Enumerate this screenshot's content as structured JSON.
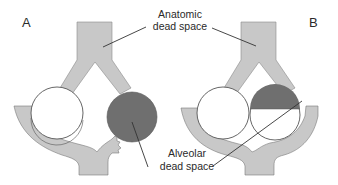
{
  "figure": {
    "type": "respiratory dead space schematic",
    "panels": [
      {
        "id": "A",
        "label": "A",
        "left_alveolus": "ventilated, perfused (white)",
        "right_alveolus": "ventilated, not perfused (entirely dark — alveolar dead space)",
        "capillary": "supplies left alveolus only; right branch ends abruptly (blocked)"
      },
      {
        "id": "B",
        "label": "B",
        "left_alveolus": "ventilated, perfused (white)",
        "right_alveolus": "partially perfused (upper half dark — alveolar dead space)",
        "capillary": "supplies both alveoli"
      }
    ],
    "annotations": {
      "anatomic": {
        "line1": "Anatomic",
        "line2": "dead space"
      },
      "alveolar": {
        "line1": "Alveolar",
        "line2": "dead space"
      }
    },
    "colors": {
      "airway": "#c8c8c8",
      "vessel": "#c8c8c8",
      "dead_space": "#6f6f6f",
      "outline": "#555555",
      "alveolus": "#ffffff"
    }
  }
}
